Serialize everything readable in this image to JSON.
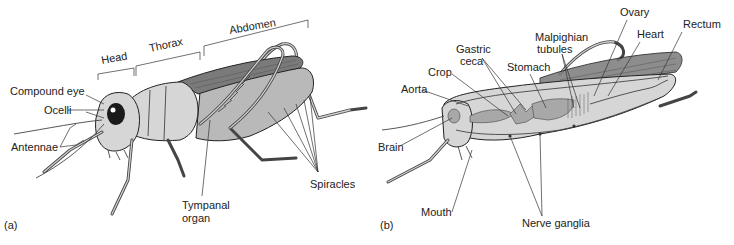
{
  "figure": {
    "panel_a": {
      "tag": "(a)",
      "regions": [
        "Head",
        "Thorax",
        "Abdomen"
      ],
      "labels": {
        "compound_eye": "Compound eye",
        "ocelli": "Ocelli",
        "antennae": "Antennae",
        "tympanal_organ_line1": "Tympanal",
        "tympanal_organ_line2": "organ",
        "spiracles": "Spiracles"
      }
    },
    "panel_b": {
      "tag": "(b)",
      "labels": {
        "ovary": "Ovary",
        "rectum": "Rectum",
        "heart": "Heart",
        "malpighian_line1": "Malpighian",
        "malpighian_line2": "tubules",
        "gastric_line1": "Gastric",
        "gastric_line2": "ceca",
        "stomach": "Stomach",
        "crop": "Crop",
        "aorta": "Aorta",
        "brain": "Brain",
        "mouth": "Mouth",
        "nerve_ganglia": "Nerve ganglia"
      }
    }
  }
}
